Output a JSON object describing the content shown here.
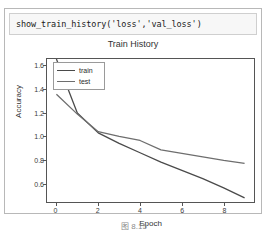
{
  "notebook": {
    "input_cell": {
      "code": "show_train_history('loss','val_loss')"
    }
  },
  "caption": "图 8.15",
  "chart_data": {
    "type": "line",
    "title": "Train History",
    "xlabel": "Epoch",
    "ylabel": "Accuracy",
    "xlim": [
      -0.45,
      9.45
    ],
    "ylim": [
      0.44,
      1.66
    ],
    "xticks": [
      "0",
      "2",
      "4",
      "6",
      "8"
    ],
    "xtick_values": [
      0,
      2,
      4,
      6,
      8
    ],
    "yticks": [
      "0.6",
      "0.8",
      "1.0",
      "1.2",
      "1.4",
      "1.6"
    ],
    "ytick_values": [
      0.6,
      0.8,
      1.0,
      1.2,
      1.4,
      1.6
    ],
    "grid": false,
    "legend_position": "upper left",
    "x": [
      0,
      1,
      2,
      3,
      4,
      5,
      6,
      7,
      8,
      9
    ],
    "series": [
      {
        "name": "train",
        "color": "#4a4a4a",
        "values": [
          1.66,
          1.2,
          1.03,
          0.94,
          0.86,
          0.78,
          0.71,
          0.64,
          0.56,
          0.475
        ]
      },
      {
        "name": "test",
        "color": "#6e6e6e",
        "values": [
          1.36,
          1.19,
          1.04,
          1.0,
          0.965,
          0.885,
          0.855,
          0.825,
          0.795,
          0.77
        ]
      }
    ]
  }
}
